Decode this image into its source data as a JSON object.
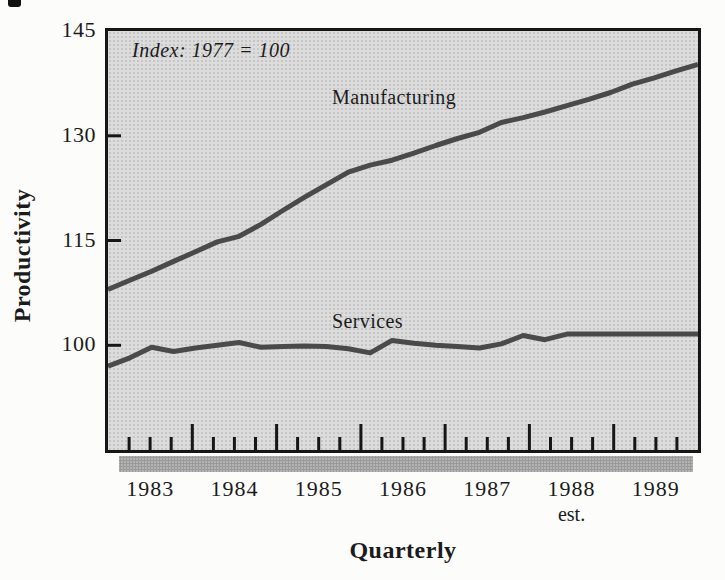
{
  "colors": {
    "line": "#4a4a4a",
    "ink": "#1b1b1b",
    "plotbg": "#dcdcdc",
    "shadow": "#b3b3b3",
    "paper": "#fcfcfa"
  },
  "chart_data": {
    "type": "line",
    "annotation": "Index: 1977 = 100",
    "xlabel": "Quarterly",
    "ylabel": "Productivity",
    "x_frequency": "quarterly",
    "x": [
      1983.0,
      1983.25,
      1983.5,
      1983.75,
      1984.0,
      1984.25,
      1984.5,
      1984.75,
      1985.0,
      1985.25,
      1985.5,
      1985.75,
      1986.0,
      1986.25,
      1986.5,
      1986.75,
      1987.0,
      1987.25,
      1987.5,
      1987.75,
      1988.0,
      1988.25,
      1988.5,
      1988.75,
      1989.0,
      1989.25,
      1989.5,
      1989.75
    ],
    "years": [
      {
        "label": "1983"
      },
      {
        "label": "1984"
      },
      {
        "label": "1985"
      },
      {
        "label": "1986"
      },
      {
        "label": "1987"
      },
      {
        "label": "1988",
        "note": "est."
      },
      {
        "label": "1989"
      }
    ],
    "yticks": [
      100,
      115,
      130,
      145
    ],
    "ylim": [
      85,
      145
    ],
    "grid": false,
    "legend_position": "inline-labels",
    "series": [
      {
        "name": "Manufacturing",
        "values": [
          108.0,
          109.3,
          110.6,
          112.0,
          113.4,
          114.8,
          115.6,
          117.3,
          119.3,
          121.2,
          123.0,
          124.8,
          125.8,
          126.5,
          127.5,
          128.6,
          129.6,
          130.5,
          131.9,
          132.6,
          133.4,
          134.3,
          135.2,
          136.2,
          137.4,
          138.3,
          139.3,
          140.2
        ]
      },
      {
        "name": "Services",
        "values": [
          97.0,
          98.2,
          99.7,
          99.1,
          99.6,
          100.0,
          100.4,
          99.7,
          99.8,
          99.9,
          99.8,
          99.5,
          98.9,
          100.7,
          100.3,
          100.0,
          99.8,
          99.6,
          100.2,
          101.4,
          100.8,
          101.6,
          101.6,
          101.6,
          101.6,
          101.6,
          101.6,
          101.6
        ]
      }
    ]
  }
}
